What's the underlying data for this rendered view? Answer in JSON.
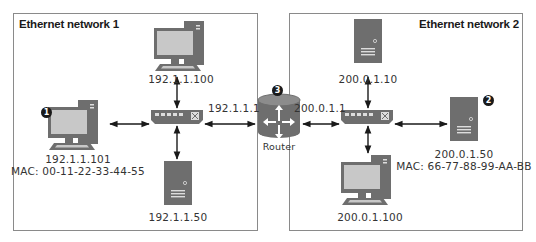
{
  "networks": [
    {
      "title": "Ethernet network 1"
    },
    {
      "title": "Ethernet network 2"
    }
  ],
  "devices": {
    "pc_top_left": {
      "ip": "192.1.1.100"
    },
    "pc_left": {
      "ip": "192.1.1.101",
      "mac": "MAC: 00-11-22-33-44-55",
      "badge": "1"
    },
    "server_bottom_left": {
      "ip": "192.1.1.50"
    },
    "router": {
      "label": "Router",
      "badge": "3",
      "left_ip": "192.1.1.1",
      "right_ip": "200.0.1.1"
    },
    "server_top_right": {
      "ip": "200.0.1.10"
    },
    "server_right": {
      "ip": "200.0.1.50",
      "mac": "MAC: 66-77-88-99-AA-BB",
      "badge": "2"
    },
    "pc_bottom_right": {
      "ip": "200.0.1.100"
    }
  },
  "colors": {
    "device_dark": "#6e6e6e",
    "device_mid": "#8c8c8c",
    "screen": "#c8c8c8",
    "border": "#8a8a8a",
    "arrow": "#1a1a1a"
  }
}
